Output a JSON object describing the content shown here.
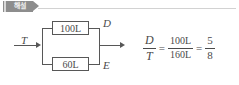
{
  "header": {
    "badge_label": "해설",
    "badge_color": "#8d8d8d",
    "rule_color": "#d2d2d2"
  },
  "diagram": {
    "input_label": "T",
    "top_node_label": "D",
    "bottom_node_label": "E",
    "top_component_label": "100L",
    "bottom_component_label": "60L",
    "line_color": "#575757"
  },
  "equation": {
    "lhs": {
      "numerator": "D",
      "denominator": "T"
    },
    "equals_1": "=",
    "middle": {
      "numerator": "100L",
      "denominator": "160L"
    },
    "equals_2": "=",
    "rhs": {
      "numerator": "5",
      "denominator": "8"
    }
  }
}
